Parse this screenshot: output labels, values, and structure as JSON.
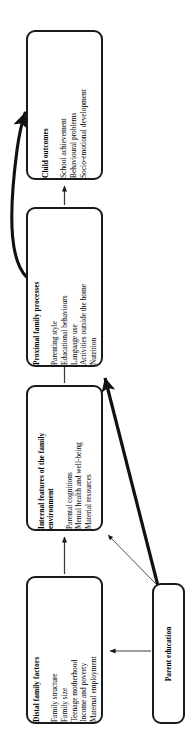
{
  "figure": {
    "type": "flowchart",
    "orientation": "rotated-90-ccw",
    "background_color": "#ffffff",
    "line_color": "#1a1a1a"
  },
  "nodes": {
    "child_outcomes": {
      "title": "Child outcomes",
      "items": [
        "School achievement",
        "Behavioural problems",
        "Socio-emotional development"
      ]
    },
    "proximal_family_processes": {
      "title": "Proximal family processes",
      "items": [
        "Parenting style",
        "Educational behaviours",
        "Language use",
        "Activities outside the home",
        "Nutrition"
      ]
    },
    "internal_features": {
      "title_line_1": "Internal features of the family",
      "title_line_2": "environment",
      "items": [
        "Parental cognitions",
        "Mental health and well-being",
        "Material resources"
      ]
    },
    "distal_family_factors": {
      "title": "Distal family factors",
      "items": [
        "Family structure",
        "Family size",
        "Teenage motherhood",
        "Income and poverty",
        "Maternal employment"
      ]
    },
    "parent_education": {
      "title": "Parent education",
      "items": []
    }
  },
  "connectors": [
    {
      "name": "proximal-to-child-outcomes",
      "from": "proximal_family_processes",
      "to": "child_outcomes",
      "style": "thin-straight"
    },
    {
      "name": "proximal-curve-to-child-outcomes",
      "from": "proximal_family_processes",
      "to": "child_outcomes",
      "style": "thick-curved"
    },
    {
      "name": "internal-to-proximal",
      "from": "internal_features",
      "to": "proximal_family_processes",
      "style": "thin-straight"
    },
    {
      "name": "distal-to-internal",
      "from": "distal_family_factors",
      "to": "internal_features",
      "style": "thin-straight"
    },
    {
      "name": "parent-education-to-proximal",
      "from": "parent_education",
      "to": "proximal_family_processes",
      "style": "thick-straight"
    },
    {
      "name": "parent-education-to-internal",
      "from": "parent_education",
      "to": "internal_features",
      "style": "thin-straight"
    },
    {
      "name": "parent-education-to-distal",
      "from": "parent_education",
      "to": "distal_family_factors",
      "style": "thin-straight"
    }
  ]
}
